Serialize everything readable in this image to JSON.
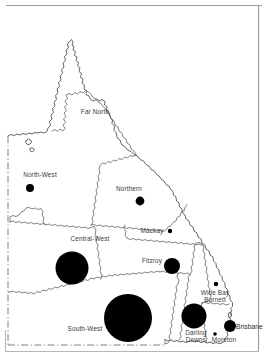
{
  "figure": {
    "kind": "proportional-symbol-map",
    "area": "Queensland statistical regions",
    "background_color": "#ffffff",
    "outline_color": "#4a4a4a",
    "symbol_color": "#000000",
    "label_color": "#3a3a3a",
    "frame": {
      "top_rule": true,
      "right_rule": true,
      "bottom_rule": true,
      "left_rule": true
    }
  },
  "chart_data": {
    "type": "scatter",
    "title": "",
    "xlabel": "",
    "ylabel": "",
    "symbol": "proportional circle",
    "regions": [
      {
        "name": "Far North",
        "label": "Far North",
        "label_x": 95,
        "label_y": 112,
        "circle": false,
        "radius": 0,
        "cx": 0,
        "cy": 0
      },
      {
        "name": "North-West",
        "label": "North-West",
        "label_x": 40,
        "label_y": 175,
        "circle": true,
        "radius": 4.0,
        "cx": 30,
        "cy": 188
      },
      {
        "name": "Northern",
        "label": "Northern",
        "label_x": 129,
        "label_y": 189,
        "circle": true,
        "radius": 4.4,
        "cx": 140,
        "cy": 201
      },
      {
        "name": "Mackay",
        "label": "Mackay",
        "label_x": 152,
        "label_y": 231,
        "circle": true,
        "radius": 2.2,
        "cx": 170,
        "cy": 231
      },
      {
        "name": "Central-West",
        "label": "Central-West",
        "label_x": 90,
        "label_y": 239,
        "circle": true,
        "radius": 16.5,
        "cx": 72,
        "cy": 268
      },
      {
        "name": "Fitzroy",
        "label": "Fitzroy",
        "label_x": 152,
        "label_y": 261,
        "circle": true,
        "radius": 8.0,
        "cx": 172,
        "cy": 266
      },
      {
        "name": "Wide Bay Burnett",
        "label": "Wide Bay\nBurnett",
        "label_x": 215,
        "label_y": 296,
        "circle": true,
        "radius": 2.2,
        "cx": 216,
        "cy": 284
      },
      {
        "name": "South-West",
        "label": "South-West",
        "label_x": 85,
        "label_y": 329,
        "circle": true,
        "radius": 24.0,
        "cx": 128,
        "cy": 318
      },
      {
        "name": "Darling Downs",
        "label": "Darling\nDowns",
        "label_x": 196,
        "label_y": 336,
        "circle": true,
        "radius": 12.5,
        "cx": 194,
        "cy": 316
      },
      {
        "name": "Moreton",
        "label": "Moreton",
        "label_x": 224,
        "label_y": 340,
        "circle": true,
        "radius": 1.8,
        "cx": 215,
        "cy": 334
      }
    ],
    "cities": [
      {
        "name": "Brisbane",
        "label": "Brisbane",
        "label_x": 236,
        "label_y": 326,
        "radius": 6.0,
        "cx": 230,
        "cy": 326
      }
    ]
  }
}
